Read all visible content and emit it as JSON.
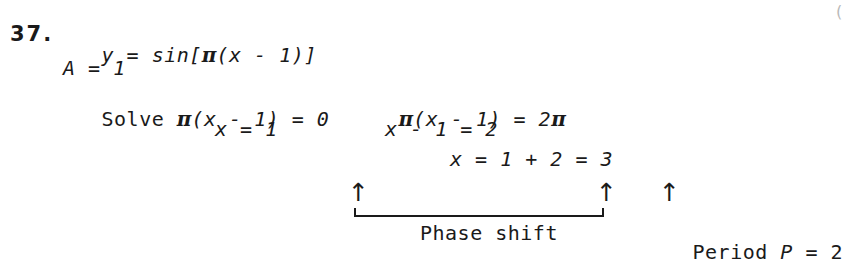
{
  "problem": {
    "number": "37.",
    "equation": "y = sin[",
    "equation_pi": "π",
    "equation_rest": "(x - 1)]",
    "amplitude": "A = 1",
    "solve_label": "Solve ",
    "left_equation_pi": "π",
    "left_equation": "(x - 1) = 0",
    "left_result": "x = 1",
    "right_equation_pi": "π",
    "right_equation_mid": "(x - 1) = 2",
    "right_equation_pi2": "π",
    "right_step1": "x - 1 = 2",
    "right_step2": "x = 1 + 2 = 3"
  },
  "annotations": {
    "arrow_glyph": "↑",
    "phase_shift_label": "Phase shift",
    "period_label_pre": "Period ",
    "period_label_var": "P",
    "period_label_post": " = 2"
  },
  "corner": {
    "mark": "("
  }
}
